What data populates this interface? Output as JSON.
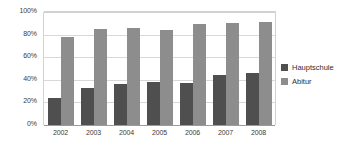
{
  "chart_data": {
    "type": "bar",
    "title": "",
    "subtitle": "",
    "xlabel": "",
    "ylabel": "",
    "categories": [
      "2002",
      "2003",
      "2004",
      "2005",
      "2006",
      "2007",
      "2008"
    ],
    "series": [
      {
        "name": "Hauptschule",
        "color": "#4f4f4f",
        "values": [
          24,
          33,
          36,
          38,
          37,
          44,
          46
        ]
      },
      {
        "name": "Abitur",
        "color": "#8d8d8d",
        "values": [
          78,
          85,
          86,
          84,
          89,
          90,
          91
        ]
      }
    ],
    "ylim": [
      0,
      100
    ],
    "ytick_values": [
      0,
      20,
      40,
      60,
      80,
      100
    ],
    "ytick_labels": [
      "0%",
      "20%",
      "40%",
      "60%",
      "80%",
      "100%"
    ],
    "grid": true,
    "grid_axis": "y",
    "legend_position": "right",
    "value_unit": "%"
  },
  "legend": {
    "entries": [
      {
        "label": "Hauptschule",
        "swatch_name": "legend-swatch-hauptschule"
      },
      {
        "label": "Abitur",
        "swatch_name": "legend-swatch-abitur"
      }
    ]
  },
  "colors": {
    "series_hauptschule": "#4f4f4f",
    "series_abitur": "#8d8d8d",
    "gridline": "#d8d8d8",
    "axis": "#9a9a9a",
    "text": "#3b3b3b",
    "background": "#ffffff"
  }
}
